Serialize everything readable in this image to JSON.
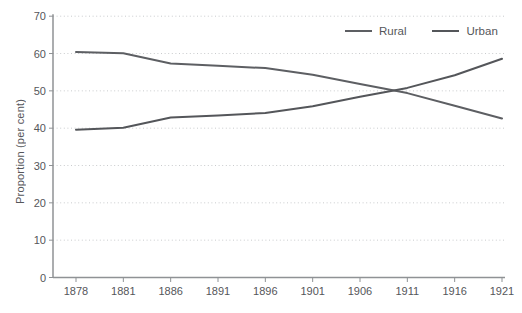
{
  "chart_data": {
    "type": "line",
    "title": "",
    "xlabel": "",
    "ylabel": "Proportion (per cent)",
    "categories": [
      "1878",
      "1881",
      "1886",
      "1891",
      "1896",
      "1901",
      "1906",
      "1911",
      "1916",
      "1921"
    ],
    "series": [
      {
        "name": "Rural",
        "color": "#5d5f63",
        "values": [
          60.4,
          60.1,
          57.3,
          56.7,
          56.1,
          54.3,
          51.8,
          49.4,
          46.0,
          42.6
        ]
      },
      {
        "name": "Urban",
        "color": "#54565a",
        "values": [
          39.6,
          40.1,
          42.9,
          43.4,
          44.1,
          45.9,
          48.4,
          50.8,
          54.2,
          58.6
        ]
      }
    ],
    "ylim": [
      0,
      70
    ],
    "yticks": [
      0,
      10,
      20,
      30,
      40,
      50,
      60,
      70
    ],
    "grid": "dotted-horizontal",
    "legend_position": "top-right-inside",
    "crossover_note": "lines cross near 1910 at ~50 per cent"
  },
  "colors": {
    "background": "#ffffff",
    "axis": "#8f9295",
    "grid": "#c9cbcd",
    "text": "#55565a"
  }
}
